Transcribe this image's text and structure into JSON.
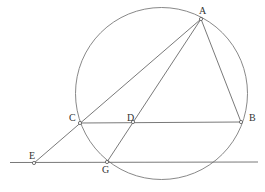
{
  "diagram": {
    "type": "geometry",
    "circle": {
      "cx": 161.5,
      "cy": 93.5,
      "r": 86
    },
    "points": {
      "A": {
        "label": "A",
        "x": 201,
        "y": 19,
        "lx": 199,
        "ly": 14
      },
      "B": {
        "label": "B",
        "x": 241,
        "y": 122,
        "lx": 249,
        "ly": 121
      },
      "C": {
        "label": "C",
        "x": 80,
        "y": 123,
        "lx": 69,
        "ly": 121
      },
      "D": {
        "label": "D",
        "x": 133,
        "y": 122,
        "lx": 127,
        "ly": 121
      },
      "E": {
        "label": "E",
        "x": 34,
        "y": 163,
        "lx": 29,
        "ly": 159
      },
      "G": {
        "label": "G",
        "x": 107,
        "y": 162,
        "lx": 102,
        "ly": 173
      }
    },
    "segments": [
      [
        "A",
        "B"
      ],
      [
        "A",
        "E"
      ],
      [
        "A",
        "G"
      ],
      [
        "C",
        "B"
      ]
    ],
    "line": {
      "name": "line-EG",
      "x1": 10,
      "y1": 162.5,
      "x2": 258,
      "y2": 162
    },
    "colors": {
      "stroke": "#6a6a6a",
      "label": "#333333",
      "background": "#ffffff"
    }
  }
}
